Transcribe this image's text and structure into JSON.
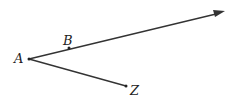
{
  "diagram": {
    "type": "geometry-rays",
    "points": {
      "A": {
        "label": "A",
        "x": 29,
        "y": 59
      },
      "B": {
        "label": "B",
        "x": 69,
        "y": 48
      },
      "Z": {
        "label": "Z",
        "x": 126,
        "y": 86
      }
    },
    "ray": {
      "from": "A",
      "through": "B",
      "arrow_tip": {
        "x": 224,
        "y": 11
      }
    },
    "segment": {
      "from": "A",
      "to": "Z"
    },
    "colors": {
      "line": "#333333",
      "text": "#222222"
    }
  }
}
